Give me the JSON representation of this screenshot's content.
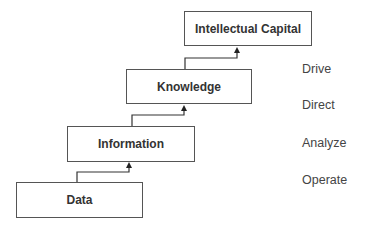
{
  "diagram": {
    "type": "staircase-hierarchy",
    "levels": [
      {
        "label": "Data",
        "box": {
          "x": 16,
          "y": 182,
          "w": 127,
          "h": 36
        }
      },
      {
        "label": "Information",
        "box": {
          "x": 67,
          "y": 126,
          "w": 128,
          "h": 36
        }
      },
      {
        "label": "Knowledge",
        "box": {
          "x": 126,
          "y": 69,
          "w": 126,
          "h": 35
        }
      },
      {
        "label": "Intellectual Capital",
        "box": {
          "x": 184,
          "y": 11,
          "w": 128,
          "h": 35
        }
      }
    ],
    "actions": [
      {
        "label": "Drive"
      },
      {
        "label": "Direct"
      },
      {
        "label": "Analyze"
      },
      {
        "label": "Operate"
      }
    ],
    "connectors": [
      {
        "from": "Data",
        "to": "Information"
      },
      {
        "from": "Information",
        "to": "Knowledge"
      },
      {
        "from": "Knowledge",
        "to": "Intellectual Capital"
      }
    ],
    "colors": {
      "line": "#333333",
      "box_border": "#555555",
      "text": "#333333",
      "action_text": "#444444"
    }
  }
}
